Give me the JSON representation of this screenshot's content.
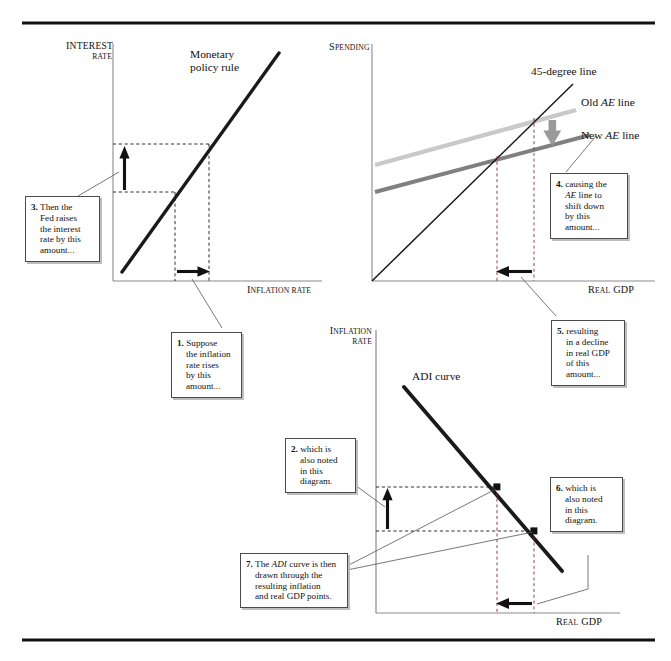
{
  "figure": {
    "title_rules": [
      "top-rule",
      "bottom-rule"
    ],
    "background": "#ffffff",
    "ink": "#111111"
  },
  "panels": {
    "interest_rate": {
      "y_axis_label_line1": "I",
      "y_axis_label_line1_rest": "NTEREST",
      "y_axis_label_line2": "RATE",
      "x_axis_label_first": "I",
      "x_axis_label_rest": "NFLATION RATE",
      "curve_label_line1": "Monetary",
      "curve_label_line2": "policy rule",
      "curve_color": "#1a1a1a"
    },
    "spending": {
      "y_axis_label_first": "S",
      "y_axis_label_rest": "PENDING",
      "x_axis_label_first": "R",
      "x_axis_label_rest": "EAL",
      "x_axis_label_tail": "GDP",
      "label_45": "45-degree line",
      "label_old_ae_pre": "Old ",
      "label_old_ae_em": "AE",
      "label_old_ae_post": " line",
      "label_new_ae_pre": "New ",
      "label_new_ae_em": "AE",
      "label_new_ae_post": " line",
      "old_ae_color": "#c9c9c9",
      "new_ae_color": "#808080",
      "shift_arrow_color": "#9a9a9a",
      "line45_color": "#1a1a1a"
    },
    "adi": {
      "y_axis_label_line1_first": "I",
      "y_axis_label_line1_rest": "NFLATION",
      "y_axis_label_line2": "RATE",
      "x_axis_label_first": "R",
      "x_axis_label_rest": "EAL",
      "x_axis_label_tail": "GDP",
      "curve_label": "ADI curve",
      "curve_color": "#1a1a1a"
    }
  },
  "callouts": [
    {
      "id": 1,
      "name": "callout-1-inflation-rises",
      "lines": [
        {
          "num": "1.",
          "text": " Suppose",
          "indent": false
        },
        {
          "text": "the inflation",
          "indent": true
        },
        {
          "text": "rate rises",
          "indent": true
        },
        {
          "text": "by this",
          "indent": true
        },
        {
          "text": "amount...",
          "indent": true
        }
      ]
    },
    {
      "id": 2,
      "name": "callout-2-also-noted",
      "lines": [
        {
          "num": "2.",
          "text": " which is",
          "indent": false
        },
        {
          "text": "also noted",
          "indent": true
        },
        {
          "text": "in this",
          "indent": true
        },
        {
          "text": "diagram.",
          "indent": true
        }
      ]
    },
    {
      "id": 3,
      "name": "callout-3-fed-raises-rate",
      "lines": [
        {
          "num": "3.",
          "text": " Then the",
          "indent": false
        },
        {
          "text": "Fed raises",
          "indent": true
        },
        {
          "text": "the interest",
          "indent": true
        },
        {
          "text": "rate by this",
          "indent": true
        },
        {
          "text": "amount...",
          "indent": true
        }
      ]
    },
    {
      "id": 4,
      "name": "callout-4-ae-shifts-down",
      "lines": [
        {
          "num": "4.",
          "text": " causing the",
          "indent": false
        },
        {
          "em": "AE",
          "text": " line to",
          "indent": true
        },
        {
          "text": "shift down",
          "indent": true
        },
        {
          "text": "by this",
          "indent": true
        },
        {
          "text": "amount...",
          "indent": true
        }
      ]
    },
    {
      "id": 5,
      "name": "callout-5-real-gdp-decline",
      "lines": [
        {
          "num": "5.",
          "text": " resulting",
          "indent": false
        },
        {
          "text": "in a decline",
          "indent": true
        },
        {
          "text": "in real GDP",
          "indent": true
        },
        {
          "text": "of this",
          "indent": true
        },
        {
          "text": "amount...",
          "indent": true
        }
      ]
    },
    {
      "id": 6,
      "name": "callout-6-also-noted",
      "lines": [
        {
          "num": "6.",
          "text": " which is",
          "indent": false
        },
        {
          "text": "also noted",
          "indent": true
        },
        {
          "text": "in this",
          "indent": true
        },
        {
          "text": "diagram.",
          "indent": true
        }
      ]
    },
    {
      "id": 7,
      "name": "callout-7-adi-drawn-through",
      "lines": [
        {
          "num": "7.",
          "pre": " The ",
          "em": "ADI",
          "text": " curve is then",
          "indent": false
        },
        {
          "text": "drawn through the",
          "indent": true
        },
        {
          "text": "resulting inflation",
          "indent": true
        },
        {
          "text": "and real GDP points.",
          "indent": true
        }
      ]
    }
  ],
  "chart_data": {
    "type": "line",
    "panels": [
      {
        "name": "Monetary policy rule panel",
        "xlabel": "Inflation rate",
        "ylabel": "Interest rate",
        "series": [
          {
            "name": "Monetary policy rule",
            "x": [
              0.06,
              0.8
            ],
            "y": [
              0.04,
              0.96
            ],
            "color": "#1a1a1a"
          }
        ],
        "guides": {
          "vertical_dashed_x": [
            0.3,
            0.46
          ],
          "horizontal_dashed_y": [
            0.38,
            0.59
          ],
          "up_arrow": "interest rate increase",
          "right_arrow": "inflation rate increase"
        }
      },
      {
        "name": "Spending / 45-degree panel",
        "xlabel": "Real GDP",
        "ylabel": "Spending",
        "series": [
          {
            "name": "45-degree line",
            "x": [
              0.0,
              0.86
            ],
            "y": [
              0.0,
              0.86
            ],
            "color": "#1a1a1a"
          },
          {
            "name": "Old AE line",
            "x": [
              0.0,
              0.88
            ],
            "y": [
              0.44,
              0.76
            ],
            "color": "#c9c9c9"
          },
          {
            "name": "New AE line",
            "x": [
              0.0,
              0.88
            ],
            "y": [
              0.3,
              0.62
            ],
            "color": "#808080"
          }
        ],
        "guides": {
          "vertical_dashed_x": [
            0.44,
            0.63
          ],
          "down_arrow": "AE line shifts down",
          "left_arrow": "real GDP falls"
        }
      },
      {
        "name": "ADI curve panel",
        "xlabel": "Real GDP",
        "ylabel": "Inflation rate",
        "series": [
          {
            "name": "ADI curve",
            "x": [
              0.14,
              0.8
            ],
            "y": [
              0.88,
              0.14
            ],
            "color": "#1a1a1a"
          }
        ],
        "points": [
          {
            "name": "new equilibrium",
            "x": 0.46,
            "y": 0.47
          },
          {
            "name": "old equilibrium",
            "x": 0.61,
            "y": 0.31
          }
        ],
        "guides": {
          "vertical_dashed_x": [
            0.46,
            0.61
          ],
          "horizontal_dashed_y": [
            0.31,
            0.47
          ],
          "up_arrow": "inflation rate increase",
          "left_arrow": "real GDP falls"
        }
      }
    ],
    "grid": false,
    "legend": "inline curve labels"
  }
}
